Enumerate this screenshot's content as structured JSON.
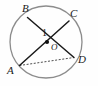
{
  "figure": {
    "background_color": "#fefefe",
    "width": 98,
    "height": 86
  },
  "circle": {
    "name": "circle-outline",
    "center_x": 46,
    "center_y": 42,
    "radius": 36,
    "stroke_color": "#8c8c8c",
    "stroke_width": 1.3,
    "fill": "none"
  },
  "center_point": {
    "label": "O",
    "x": 47,
    "y": 42,
    "dot_radius": 2.1,
    "dot_color": "#111111",
    "label_x": 51,
    "label_y": 50
  },
  "points": [
    {
      "id": "B",
      "label": "B",
      "x": 27.5,
      "y": 17.5,
      "label_x": 22,
      "label_y": 12
    },
    {
      "id": "C",
      "label": "C",
      "x": 69.0,
      "y": 21.0,
      "label_x": 70,
      "label_y": 17
    },
    {
      "id": "A",
      "label": "A",
      "x": 19.5,
      "y": 65.5,
      "label_x": 7,
      "label_y": 74
    },
    {
      "id": "D",
      "label": "D",
      "x": 74.0,
      "y": 57.5,
      "label_x": 78,
      "label_y": 63
    }
  ],
  "chords": [
    {
      "id": "BD",
      "name": "chord-b-to-d",
      "from": "B",
      "to": "D",
      "style": "solid",
      "stroke_color": "#1a1a1a",
      "stroke_width": 1.5
    },
    {
      "id": "AC",
      "name": "chord-a-to-c",
      "from": "A",
      "to": "C",
      "style": "solid",
      "stroke_color": "#1a1a1a",
      "stroke_width": 1.5
    },
    {
      "id": "AD",
      "name": "segment-a-to-d-dashed",
      "from": "A",
      "to": "D",
      "style": "dashed",
      "stroke_color": "#3a3a3a",
      "stroke_width": 0.9,
      "dash_pattern": "2,1.6"
    }
  ],
  "angles": [
    {
      "id": "1",
      "label": "1",
      "at_point": "intersection",
      "x": 52,
      "y": 33,
      "label_x": 42,
      "label_y": 36
    }
  ],
  "intersection": {
    "name": "chord-intersection-point",
    "x": 52,
    "y": 33
  }
}
